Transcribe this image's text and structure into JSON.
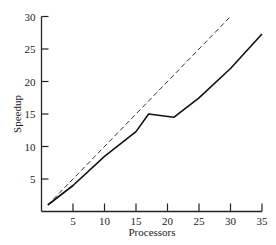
{
  "chart_data": {
    "type": "line",
    "title": "",
    "xlabel": "Processors",
    "ylabel": "Speedup",
    "xlim": [
      0,
      35
    ],
    "ylim": [
      0,
      30
    ],
    "xticks": [
      5,
      10,
      15,
      20,
      25,
      30,
      35
    ],
    "yticks": [
      5,
      10,
      15,
      20,
      25,
      30
    ],
    "grid": false,
    "legend": null,
    "series": [
      {
        "name": "Ideal speedup",
        "style": "dashed",
        "color": "#333333",
        "x": [
          1,
          30
        ],
        "y": [
          1,
          30
        ]
      },
      {
        "name": "Measured speedup",
        "style": "solid",
        "color": "#111111",
        "x": [
          1,
          5,
          10,
          15,
          17,
          21,
          25,
          30,
          35
        ],
        "y": [
          1,
          4,
          8.5,
          12.3,
          15,
          14.5,
          17.5,
          22,
          27.3
        ]
      }
    ]
  }
}
